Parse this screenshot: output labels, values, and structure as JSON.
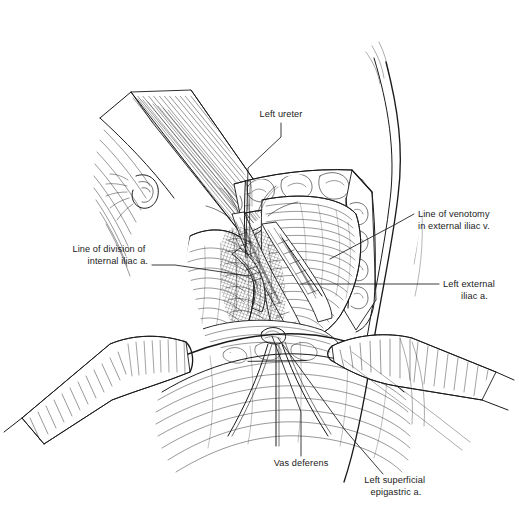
{
  "figure": {
    "kind": "surgical-illustration",
    "technique": "pen-and-ink line drawing with hatching",
    "background_color": "#ffffff",
    "ink_color": "#1a1a1a",
    "width": 519,
    "height": 522
  },
  "labels": [
    {
      "id": "left-ureter",
      "text": "Left ureter",
      "lines": [
        "Left ureter"
      ],
      "anchor": "middle",
      "text_x": 281,
      "text_y": 117,
      "leader": "M 281,123 L 281,137 L 248,168 L 246,246",
      "target_x": 246,
      "target_y": 246
    },
    {
      "id": "line-of-venotomy",
      "text": "Line of venotomy in external iliac v.",
      "lines": [
        "Line of venotomy",
        "in external iliac v."
      ],
      "anchor": "start",
      "text_x": 418,
      "text_y": 217,
      "leader": "M 414,214 L 396,224 L 330,259",
      "target_x": 330,
      "target_y": 259
    },
    {
      "id": "line-of-division",
      "text": "Line of division of internal iliac a.",
      "lines": [
        "Line of division of",
        "internal iliac a."
      ],
      "anchor": "end",
      "text_x": 148,
      "text_y": 252,
      "leader": "M 152,265 L 175,265 L 249,276",
      "target_x": 249,
      "target_y": 276
    },
    {
      "id": "left-external-iliac-a",
      "text": "Left external iliac a.",
      "lines": [
        "Left external",
        "iliac a."
      ],
      "anchor": "start",
      "text_x": 443,
      "text_y": 287,
      "leader": "M 439,284 L 300,284",
      "target_x": 300,
      "target_y": 284
    },
    {
      "id": "vas-deferens",
      "text": "Vas deferens",
      "lines": [
        "Vas deferens"
      ],
      "anchor": "middle",
      "text_x": 301,
      "text_y": 466,
      "leader": "M 301,456 L 301,412 L 272,336",
      "target_x": 272,
      "target_y": 336
    },
    {
      "id": "left-superficial-epigastric-a",
      "text": "Left superficial epigastric a.",
      "lines": [
        "Left superficial",
        "epigastric a."
      ],
      "anchor": "middle",
      "text_x": 396,
      "text_y": 483,
      "leader": "M 383,474 L 345,430 L 278,338",
      "target_x": 278,
      "target_y": 338
    }
  ],
  "anatomy_regions": [
    {
      "id": "abdominal-skin-flank",
      "name": "Abdominal skin and flank contour"
    },
    {
      "id": "upper-left-retractor",
      "name": "Upper left retractor blade"
    },
    {
      "id": "lower-left-retractor",
      "name": "Lower left retractor blade"
    },
    {
      "id": "lower-right-retractor",
      "name": "Lower right retractor blade"
    },
    {
      "id": "wound-edge-fat",
      "name": "Subcutaneous fat at wound margin"
    },
    {
      "id": "rectus-muscle-flap",
      "name": "Reflected muscle flap"
    },
    {
      "id": "iliac-vessel-bundle",
      "name": "Iliac vessel bundle with lymphatics"
    },
    {
      "id": "psoas-muscle",
      "name": "Psoas muscle bed"
    },
    {
      "id": "vessel-loops",
      "name": "Vessel loops / ties"
    }
  ]
}
